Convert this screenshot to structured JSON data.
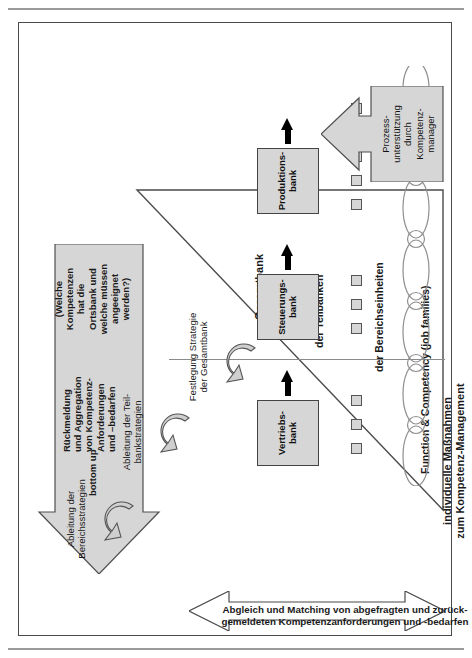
{
  "diagram": {
    "title_right": "individuelle Maßnahmen\nzum Kompetenz-Management",
    "big_arrow": {
      "direction_label": "bottom up",
      "line1": "Rückmeldung\nund Aggregation\nvon Kompetenz-\nAnforderungen\nund –bedarfen",
      "line2": "(Welche\nKompetenzen\nhat die\nOrtsbank und\nwelche müssen\nangeeignet\nwerden?)"
    },
    "double_arrow_label": "Abgleich und Matching von abgefragten und zurück-\ngemeldeten Kompetenzanforderungen und -bedarfen",
    "curved_labels": {
      "strategy": "Festlegung Strategie\nder Gesamtbank",
      "subbank": "Ableitung der Teil-\nbankstrategien",
      "division": "Ableitung der\nBereichsstrategien"
    },
    "level_labels": {
      "gesamtbank": "Gesamtbank",
      "teilbanken": "der Teilbanken",
      "bereichseinheiten": "der Bereichseinheiten",
      "job_families": "Function & Competency (job families)"
    },
    "bank_boxes": [
      {
        "label": "Produktions-\nbank"
      },
      {
        "label": "Steuerungs-\nbank"
      },
      {
        "label": "Vertriebs-\nbank"
      }
    ],
    "process_support": "Prozess-\nunterstützung\ndurch\nKompetenz-\nmanager",
    "colors": {
      "fill_gray": "#d6d6d6",
      "stroke": "#444444",
      "black": "#000000",
      "frame": "#4a4a4a"
    }
  }
}
